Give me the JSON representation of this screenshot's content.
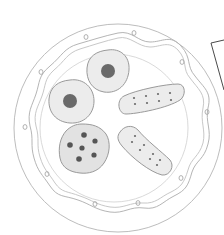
{
  "scene": {
    "description": "Pencil sketch of a decorated plate holding five biscuits",
    "colors": {
      "background": "#ffffff",
      "outline": "#9a9a9a",
      "light_outline": "#c4c4c4",
      "biscuit_fill": "#ececec",
      "biscuit_fill_dark": "#e2e2e2",
      "dot": "#6a6a6a",
      "frame_line": "#4a4a4a"
    },
    "plate": {
      "shape": "circle",
      "decoration": "wavy inner border with small ring dots around rim",
      "rim_dots": 12
    },
    "items": [
      {
        "name": "round-biscuit-center-dot-top",
        "shape": "round",
        "detail": "single dark center dot"
      },
      {
        "name": "round-biscuit-center-dot-left",
        "shape": "round",
        "detail": "single dark center dot"
      },
      {
        "name": "chocolate-chip-cookie",
        "shape": "round-irregular",
        "detail": "6 dark chips"
      },
      {
        "name": "rectangular-cracker-top",
        "shape": "rectangle",
        "detail": "8 small holes"
      },
      {
        "name": "rectangular-cracker-bottom",
        "shape": "rectangle-tilted",
        "detail": "8 small holes"
      }
    ],
    "frame_corner": {
      "position": "top-right",
      "detail": "partial dark rectangle outline"
    }
  }
}
